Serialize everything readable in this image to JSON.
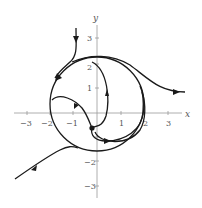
{
  "figure": {
    "type": "phase-portrait",
    "axes": {
      "x_label": "x",
      "y_label": "y",
      "x_ticks": [
        "−3",
        "−2",
        "−1",
        "1",
        "2",
        "3"
      ],
      "y_ticks": [
        "3",
        "2",
        "1",
        "−1",
        "−2",
        "−3"
      ]
    },
    "colors": {
      "curve": "#1a1a1a",
      "axis": "#888888",
      "text": "#555555"
    },
    "features": {
      "limit_cycle": "circle of radius 2 centered at origin",
      "equilibrium": "dot near (−0.2, −0.6)"
    }
  }
}
